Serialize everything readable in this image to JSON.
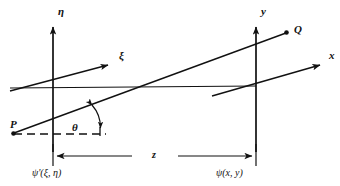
{
  "figure": {
    "type": "optics-coordinate-diagram",
    "background_color": "#ffffff",
    "ink_color": "#111111"
  },
  "labels": {
    "eta_axis": "η",
    "xi_axis": "ξ",
    "y_axis": "y",
    "x_axis": "x",
    "point_p": "P",
    "point_q": "Q",
    "angle_theta": "θ",
    "distance_z": "z",
    "input_field": "ψ'(ξ, η)",
    "output_field": "ψ(x, y)"
  },
  "geometry": {
    "input_plane_x": 53,
    "output_plane_x": 256,
    "optical_axis_y": 86,
    "separation_label": "z",
    "point_p": {
      "x": 13,
      "y": 133
    },
    "point_q": {
      "x": 287,
      "y": 32
    },
    "eta_arrow_tip": {
      "x": 53,
      "y": 22
    },
    "y_arrow_tip": {
      "x": 256,
      "y": 22
    },
    "xi_arrow_tip": {
      "x": 113,
      "y": 62
    },
    "x_arrow_tip": {
      "x": 325,
      "y": 62
    },
    "dim_line_y": 156,
    "theta_arc_center": {
      "x": 64,
      "y": 129
    }
  }
}
